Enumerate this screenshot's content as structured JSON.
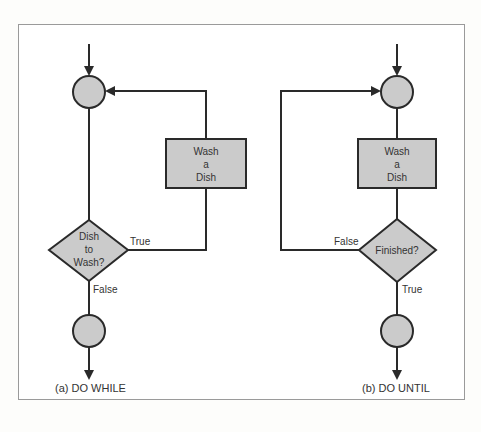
{
  "colors": {
    "line": "#2a2a2a",
    "node_fill": "#cbcbcb",
    "frame_border": "#9a9a9a",
    "background": "#ffffff"
  },
  "diagrams": [
    {
      "id": "do-while",
      "caption": "(a) DO WHILE",
      "process": {
        "lines": [
          "Wash",
          "a",
          "Dish"
        ]
      },
      "decision": {
        "lines": [
          "Dish",
          "to",
          "Wash?"
        ]
      },
      "edges": {
        "loop_label": "True",
        "exit_label": "False"
      }
    },
    {
      "id": "do-until",
      "caption": "(b) DO UNTIL",
      "process": {
        "lines": [
          "Wash",
          "a",
          "Dish"
        ]
      },
      "decision": {
        "lines": [
          "Finished?"
        ]
      },
      "edges": {
        "loop_label": "False",
        "exit_label": "True"
      }
    }
  ]
}
